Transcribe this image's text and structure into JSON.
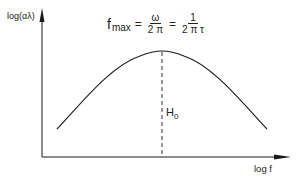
{
  "diagram": {
    "y_axis_label": "log(αλ)",
    "x_axis_label": "log f",
    "peak_label_main": "H",
    "peak_label_sub": "0",
    "formula": {
      "lhs_main": "f",
      "lhs_sub": "max",
      "equals1": "=",
      "frac1_num": "ω",
      "frac1_den": "2 π",
      "equals2": "=",
      "frac2_num": "1",
      "frac2_den": "2 π τ"
    },
    "curve": {
      "shape": "bell-shaped peak on log-log axes",
      "start": [
        57,
        129
      ],
      "peak": [
        162,
        51
      ],
      "end": [
        267,
        129
      ]
    },
    "colors": {
      "line": "#1a1a1a",
      "background": "#ffffff"
    }
  }
}
